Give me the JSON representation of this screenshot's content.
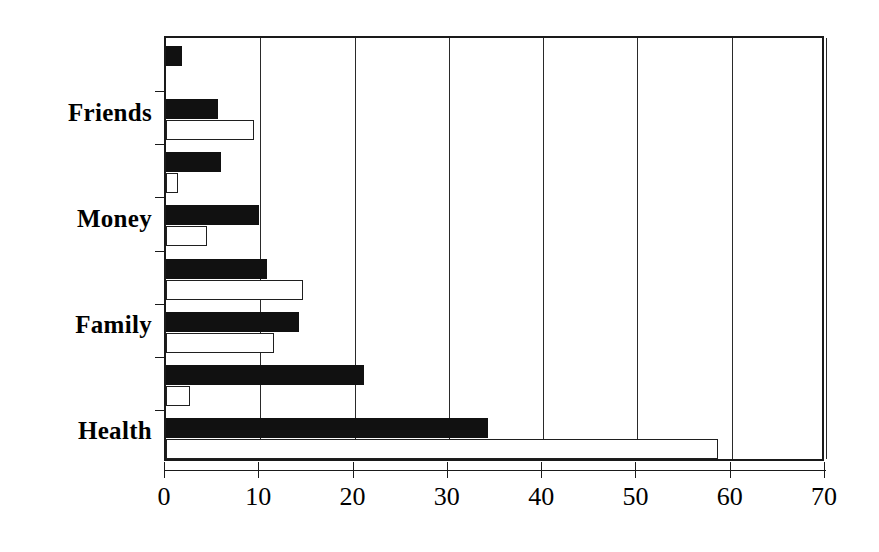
{
  "chart_data": {
    "type": "bar",
    "orientation": "horizontal",
    "title": "",
    "subtitle": "",
    "xlabel": "",
    "ylabel": "",
    "xlim": [
      0,
      70
    ],
    "xticks": [
      0,
      10,
      20,
      30,
      40,
      50,
      60,
      70
    ],
    "xticklabels": [
      "0",
      "10",
      "20",
      "30",
      "40",
      "50",
      "60",
      "70"
    ],
    "grid": "vertical",
    "legend": "none",
    "categories": [
      "",
      "Friends",
      "",
      "Money",
      "",
      "Family",
      "",
      "Health"
    ],
    "category_labels_visible": [
      "Friends",
      "Money",
      "Family",
      "Health"
    ],
    "series": [
      {
        "name": "series-filled",
        "style": "filled-black",
        "color": "#111111",
        "values": [
          1.7,
          5.5,
          5.8,
          9.9,
          10.7,
          14.1,
          21.0,
          34.2
        ]
      },
      {
        "name": "series-hollow",
        "style": "white-outline",
        "color": "#ffffff",
        "values": [
          0,
          9.3,
          1.3,
          4.4,
          14.5,
          11.5,
          2.5,
          58.5
        ]
      }
    ]
  },
  "axis": {
    "y_labels": [
      {
        "text": "Friends",
        "index": 1
      },
      {
        "text": "Money",
        "index": 3
      },
      {
        "text": "Family",
        "index": 5
      },
      {
        "text": "Health",
        "index": 7
      }
    ]
  },
  "colors": {
    "bar_filled": "#111111",
    "bar_hollow_fill": "#ffffff",
    "bar_outline": "#1f1f1f",
    "axis": "#1a1a1a",
    "background": "#ffffff"
  }
}
